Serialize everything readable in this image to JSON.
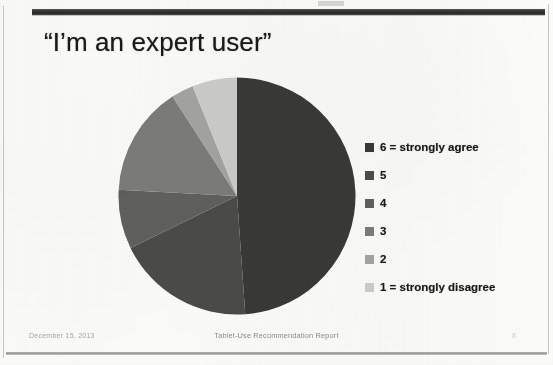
{
  "slide": {
    "title": "“I’m an expert user”",
    "background_color": "#fdfdfc",
    "header_bar_color": "#333331"
  },
  "footer": {
    "date": "December 15,  2013",
    "report_title": "Tablet-Use Recommendation Report",
    "page_number": "8"
  },
  "legend": {
    "position": "right",
    "items": [
      {
        "label": "6 = strongly agree",
        "color": "#3c3c3a"
      },
      {
        "label": "5",
        "color": "#4e4e4c"
      },
      {
        "label": "4",
        "color": "#636361"
      },
      {
        "label": "3",
        "color": "#7e7e7b"
      },
      {
        "label": "2",
        "color": "#a6a6a3"
      },
      {
        "label": "1 = strongly disagree",
        "color": "#cfcfcc"
      }
    ]
  },
  "chart_data": {
    "type": "pie",
    "title": "“I’m an expert user”",
    "xlabel": "",
    "ylabel": "",
    "legend_position": "right",
    "grid": false,
    "start_angle_deg": 0,
    "direction": "clockwise",
    "categories": [
      "6 = strongly agree",
      "5",
      "4",
      "3",
      "2",
      "1 = strongly disagree"
    ],
    "values": [
      49,
      19,
      8,
      15,
      3,
      6
    ],
    "unit": "percent",
    "colors": [
      "#3c3c3a",
      "#4e4e4c",
      "#636361",
      "#7e7e7b",
      "#a6a6a3",
      "#cfcfcc"
    ],
    "slices": [
      {
        "label": "6 = strongly agree",
        "value": 49,
        "color": "#3c3c3a",
        "start_deg": 0,
        "end_deg": 176
      },
      {
        "label": "5",
        "value": 19,
        "color": "#4e4e4c",
        "start_deg": 176,
        "end_deg": 244
      },
      {
        "label": "4",
        "value": 8,
        "color": "#636361",
        "start_deg": 244,
        "end_deg": 273
      },
      {
        "label": "3",
        "value": 15,
        "color": "#7e7e7b",
        "start_deg": 273,
        "end_deg": 327
      },
      {
        "label": "2",
        "value": 3,
        "color": "#a6a6a3",
        "start_deg": 327,
        "end_deg": 338
      },
      {
        "label": "1 = strongly disagree",
        "value": 6,
        "color": "#cfcfcc",
        "start_deg": 338,
        "end_deg": 360
      }
    ]
  }
}
